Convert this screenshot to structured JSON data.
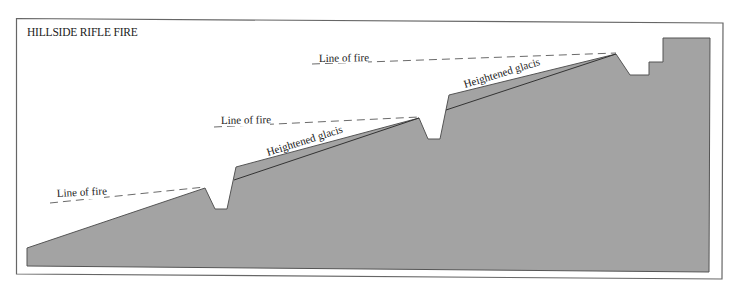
{
  "title": "HILLSIDE RIFLE FIRE",
  "colors": {
    "ground_fill": "#a3a3a3",
    "ground_stroke": "#555555",
    "frame": "#666666",
    "line": "#333333"
  },
  "labels": {
    "line_of_fire_1": "Line of fire",
    "line_of_fire_2": "Line of fire",
    "line_of_fire_3": "Line of fire",
    "glacis_1": "Heightened glacis",
    "glacis_2": "Heightened glacis"
  }
}
